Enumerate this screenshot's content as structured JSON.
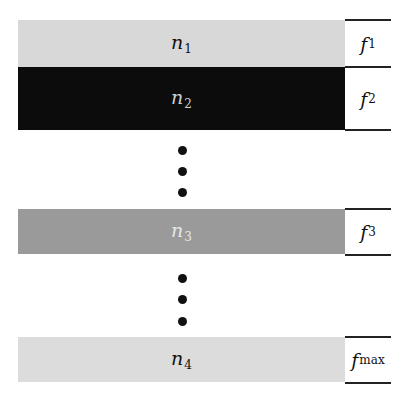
{
  "diagram": {
    "bands": [
      {
        "name": "n",
        "sub": "1",
        "color": "#d8d8d8",
        "text_color": "#111111",
        "freq": "f",
        "freq_sub": "1"
      },
      {
        "name": "n",
        "sub": "2",
        "color": "#0c0c0c",
        "text_color": "#cfcfcf",
        "freq": "f",
        "freq_sub": "2"
      },
      {
        "name": "n",
        "sub": "3",
        "color": "#9a9a9a",
        "text_color": "#e6e6e6",
        "freq": "f",
        "freq_sub": "3"
      },
      {
        "name": "n",
        "sub": "4",
        "color": "#dcdcdc",
        "text_color": "#111111",
        "freq": "f",
        "freq_sub": "max"
      }
    ],
    "ellipsis": [
      "•",
      "•",
      "•"
    ]
  }
}
